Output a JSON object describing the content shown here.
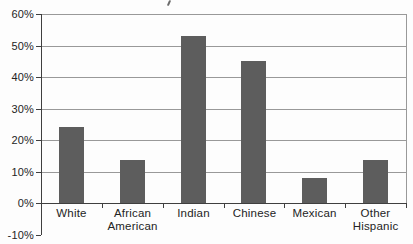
{
  "chart_data": {
    "type": "bar",
    "title": "",
    "categories": [
      "White",
      "African American",
      "Indian",
      "Chinese",
      "Mexican",
      "Other Hispanic"
    ],
    "values": [
      24,
      13.5,
      53,
      45,
      8,
      13.5
    ],
    "series_unit": "%",
    "yticks": [
      {
        "value": 60,
        "label": "60%"
      },
      {
        "value": 50,
        "label": "50%"
      },
      {
        "value": 40,
        "label": "40%"
      },
      {
        "value": 30,
        "label": "30%"
      },
      {
        "value": 20,
        "label": "20%"
      },
      {
        "value": 10,
        "label": "10%"
      },
      {
        "value": 0,
        "label": "0%"
      },
      {
        "value": -10,
        "label": "-10%"
      }
    ],
    "ylim": [
      -10,
      60
    ],
    "xlabel": "",
    "ylabel": "",
    "grid": true,
    "legend": false,
    "layout_hints": {
      "gridlines_horizontal_every": 10,
      "baseline_value": 0,
      "plot_border": "top-right-left",
      "legend_position": "none"
    },
    "colors": {
      "bar": "#5d5d5d",
      "gridline": "#999999",
      "axis": "#3f3f3f",
      "text": "#242424",
      "background": "#fdfdfd"
    }
  }
}
